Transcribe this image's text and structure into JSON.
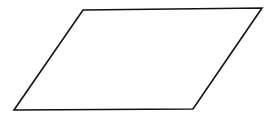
{
  "diagram": {
    "shape": "parallelogram",
    "stroke_color": "#111111",
    "fill_color": "#ffffff",
    "stroke_width": 1.6,
    "points": "83,10 262,8 193,109 14,110"
  }
}
